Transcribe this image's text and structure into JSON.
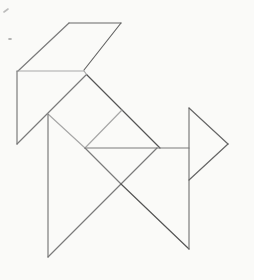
{
  "figure": {
    "canvas": {
      "width": 254,
      "height": 280,
      "background": "#fafaf8"
    },
    "colors": {
      "dark": "#4d4d4d",
      "medium_dark": "#5f5f5f",
      "medium": "#757575",
      "light": "#a3a3a3"
    },
    "stroke_width": 1.2,
    "segments": [
      {
        "name": "parallelogram-top-edge",
        "shade": "medium_dark",
        "points": [
          [
            69,
            23
          ],
          [
            121,
            23
          ]
        ]
      },
      {
        "name": "parallelogram-left-edge",
        "shade": "medium",
        "points": [
          [
            69,
            23
          ],
          [
            18,
            71
          ]
        ]
      },
      {
        "name": "parallelogram-right-edge",
        "shade": "medium_dark",
        "points": [
          [
            121,
            23
          ],
          [
            84,
            70
          ]
        ]
      },
      {
        "name": "shoulder-horizontal-edge",
        "shade": "light",
        "points": [
          [
            17,
            71
          ],
          [
            84,
            71
          ]
        ]
      },
      {
        "name": "left-vertical-edge",
        "shade": "medium",
        "points": [
          [
            17,
            71
          ],
          [
            17,
            144
          ]
        ]
      },
      {
        "name": "left-hypotenuse-edge",
        "shade": "medium",
        "points": [
          [
            17,
            144
          ],
          [
            86,
            75
          ]
        ]
      },
      {
        "name": "apex-notch-connector",
        "shade": "light",
        "points": [
          [
            84,
            71
          ],
          [
            87,
            75
          ]
        ]
      },
      {
        "name": "back-diagonal-edge",
        "shade": "dark",
        "points": [
          [
            87,
            75
          ],
          [
            160,
            148
          ]
        ]
      },
      {
        "name": "belly-horizontal-edge",
        "shade": "medium",
        "points": [
          [
            85,
            148
          ],
          [
            189,
            148
          ]
        ]
      },
      {
        "name": "square-right-inner-edge",
        "shade": "light",
        "points": [
          [
            122,
            110
          ],
          [
            85,
            148
          ]
        ]
      },
      {
        "name": "square-left-inner-edge",
        "shade": "light",
        "points": [
          [
            48,
            114
          ],
          [
            85,
            148
          ]
        ]
      },
      {
        "name": "thigh-inner-diagonal",
        "shade": "medium",
        "points": [
          [
            85,
            148
          ],
          [
            121,
            184
          ]
        ]
      },
      {
        "name": "front-leg-vertical-edge",
        "shade": "medium",
        "points": [
          [
            48,
            114
          ],
          [
            48,
            257
          ]
        ]
      },
      {
        "name": "front-leg-diagonal-edge",
        "shade": "medium",
        "points": [
          [
            48,
            257
          ],
          [
            157,
            148
          ]
        ]
      },
      {
        "name": "hind-leg-diagonal-edge",
        "shade": "dark",
        "points": [
          [
            121,
            184
          ],
          [
            189,
            249
          ]
        ]
      },
      {
        "name": "chest-vertical-edge",
        "shade": "medium",
        "points": [
          [
            189,
            108
          ],
          [
            189,
            249
          ]
        ]
      },
      {
        "name": "head-top-edge",
        "shade": "medium_dark",
        "points": [
          [
            189,
            108
          ],
          [
            228,
            144
          ]
        ]
      },
      {
        "name": "head-bottom-edge",
        "shade": "medium_dark",
        "points": [
          [
            228,
            144
          ],
          [
            189,
            180
          ]
        ]
      }
    ],
    "specks": [
      {
        "name": "scan-speck-dash",
        "points": [
          [
            4,
            12
          ],
          [
            8,
            9
          ]
        ],
        "shade": "light"
      },
      {
        "name": "scan-speck-dot",
        "points": [
          [
            9,
            39
          ],
          [
            11,
            39
          ]
        ],
        "shade": "medium"
      }
    ]
  }
}
